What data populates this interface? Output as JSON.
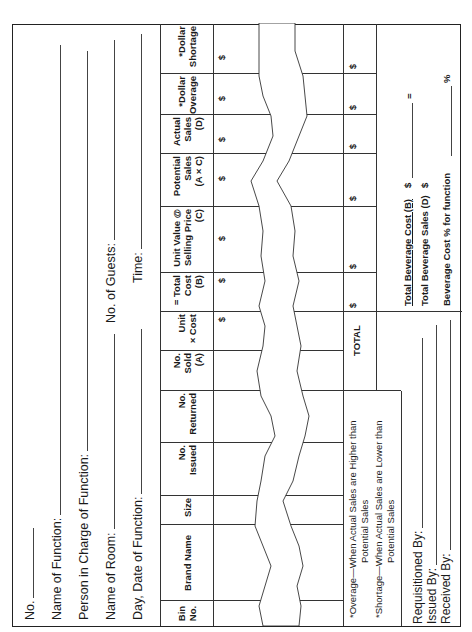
{
  "form": {
    "orientation": "rotated-90-ccw",
    "header_fields": [
      {
        "label": "No.",
        "value": ""
      },
      {
        "label": "Name of Function:",
        "value": ""
      },
      {
        "label": "Person in Charge of Function:",
        "value": ""
      },
      {
        "label": "Name of Room:",
        "value": ""
      },
      {
        "label": "Day, Date of Function:",
        "value": ""
      }
    ],
    "right_fields": [
      {
        "label": "No. of Guests:",
        "value": ""
      },
      {
        "label": "Time:",
        "value": ""
      }
    ],
    "table": {
      "columns": [
        {
          "key": "bin_no",
          "label": "Bin\nNo."
        },
        {
          "key": "brand_name",
          "label": "Brand Name"
        },
        {
          "key": "size",
          "label": "Size"
        },
        {
          "key": "no_issued",
          "label": "No.\nIssued"
        },
        {
          "key": "no_returned",
          "label": "No.\nReturned"
        },
        {
          "key": "no_sold",
          "label": "No.\nSold\n(A)"
        },
        {
          "key": "unit_cost",
          "label": "Unit\n× Cost"
        },
        {
          "key": "total_cost",
          "label": "= Total\nCost\n(B)"
        },
        {
          "key": "unit_value",
          "label": "Unit Value @\nSelling Price\n(C)"
        },
        {
          "key": "potential_sales",
          "label": "Potential\nSales\n(A × C)"
        },
        {
          "key": "actual_sales",
          "label": "Actual\nSales\n(D)"
        },
        {
          "key": "dollar_overage",
          "label": "*Dollar\nOverage"
        },
        {
          "key": "dollar_shortage",
          "label": "*Dollar\nShortage"
        }
      ],
      "currency_symbol": "$",
      "rows": [
        {
          "bin_no": "",
          "brand_name": "",
          "size": "",
          "no_issued": "",
          "no_returned": "",
          "no_sold": "",
          "unit_cost": "$",
          "total_cost": "$",
          "unit_value": "$",
          "potential_sales": "$",
          "actual_sales": "$",
          "dollar_overage": "$",
          "dollar_shortage": "$"
        }
      ],
      "total_row": {
        "label": "TOTAL",
        "total_cost": "$",
        "unit_value": "$",
        "potential_sales": "$",
        "actual_sales": "$",
        "dollar_overage": "$",
        "dollar_shortage": "$"
      }
    },
    "footnotes": [
      {
        "line1": "*Overage—When Actual Sales are Higher than",
        "line2": "Potential Sales"
      },
      {
        "line1": "*Shortage—When Actual Sales are Lower than",
        "line2": "Potential Sales"
      }
    ],
    "summary": {
      "cost_label": "Total Beverage Cost (B)",
      "cost_symbol": "$",
      "sales_label": "Total Beverage Sales (D)",
      "sales_symbol": "$",
      "equals": "=",
      "pct_label": "Beverage Cost % for function",
      "pct_symbol": "%"
    },
    "signatures": [
      {
        "label": "Requisitioned By:",
        "value": ""
      },
      {
        "label": "Issued By:",
        "value": ""
      },
      {
        "label": "Received By:",
        "value": ""
      }
    ]
  }
}
